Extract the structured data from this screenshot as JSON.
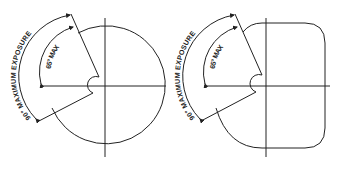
{
  "figures": [
    {
      "id": "round",
      "shape": "circle",
      "labels": {
        "outer_arc": "90° MAXIMUM EXPOSURE",
        "inner_arc": "65° MAX"
      }
    },
    {
      "id": "rounded-square",
      "shape": "rounded-square",
      "labels": {
        "outer_arc": "90° MAXIMUM EXPOSURE",
        "inner_arc": "65° MAX"
      }
    }
  ],
  "colors": {
    "line": "#222222",
    "background": "#ffffff"
  }
}
